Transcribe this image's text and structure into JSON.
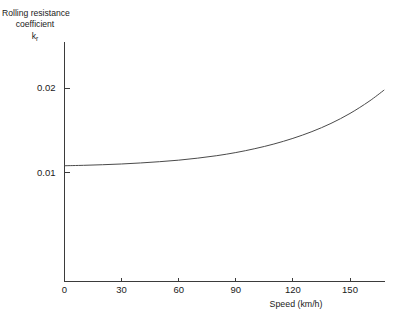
{
  "chart_data": {
    "type": "line",
    "title": "",
    "subtitle": "",
    "xlabel": "Speed (km/h)",
    "ylabel_lines": [
      "Rolling resistance",
      "coefficient"
    ],
    "ylabel_symbol": "k",
    "ylabel_symbol_subscript": "r",
    "xlim": [
      0,
      169
    ],
    "ylim": [
      0,
      0.0239
    ],
    "xticks": [
      0,
      30,
      60,
      90,
      120,
      150
    ],
    "xticklabels": [
      "0",
      "30",
      "60",
      "90",
      "120",
      "150"
    ],
    "yticks": [
      0.01,
      0.02
    ],
    "yticklabels": [
      "0.01",
      "0.02"
    ],
    "grid": false,
    "legend": false,
    "legend_position": "none",
    "line_color": "#4a4a4a",
    "axis_color": "#3b3b3b",
    "background_color": "#ffffff",
    "series": [
      {
        "name": "Rolling resistance coefficient vs speed",
        "x": [
          0,
          10,
          20,
          30,
          40,
          50,
          60,
          70,
          80,
          90,
          100,
          110,
          120,
          130,
          140,
          150,
          160,
          168
        ],
        "values": [
          0.0108,
          0.01085,
          0.01092,
          0.01101,
          0.01113,
          0.01128,
          0.01146,
          0.0117,
          0.01199,
          0.01236,
          0.01282,
          0.01337,
          0.01404,
          0.01484,
          0.01581,
          0.01699,
          0.01842,
          0.01977
        ]
      }
    ]
  }
}
